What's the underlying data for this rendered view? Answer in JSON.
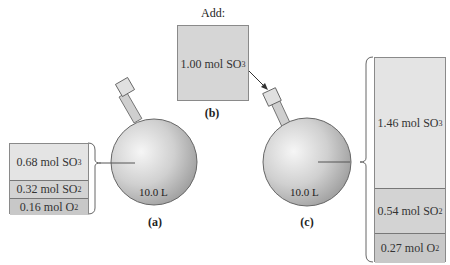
{
  "panel_a": {
    "label": "(a)",
    "volume": "10.0 L",
    "contents": [
      {
        "amount": "0.68 mol",
        "species": "SO",
        "sub": "3"
      },
      {
        "amount": "0.32 mol",
        "species": "SO",
        "sub": "2"
      },
      {
        "amount": "0.16 mol",
        "species": "O",
        "sub": "2"
      }
    ]
  },
  "panel_b": {
    "label": "(b)",
    "heading": "Add:",
    "contents": [
      {
        "amount": "1.00 mol",
        "species": "SO",
        "sub": "3"
      }
    ]
  },
  "panel_c": {
    "label": "(c)",
    "volume": "10.0 L",
    "contents": [
      {
        "amount": "1.46 mol",
        "species": "SO",
        "sub": "3"
      },
      {
        "amount": "0.54 mol",
        "species": "SO",
        "sub": "2"
      },
      {
        "amount": "0.27 mol",
        "species": "O",
        "sub": "2"
      }
    ]
  },
  "colors": {
    "flask": "#c9c9c9",
    "box_light": "#e4e4e4",
    "box_mid": "#d3d3d3"
  }
}
